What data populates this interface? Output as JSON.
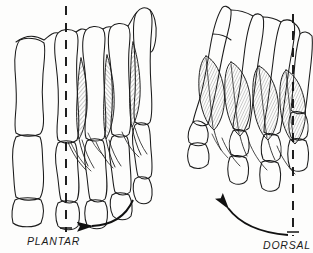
{
  "figure": {
    "title_left": "PLANTAR",
    "title_right": "DORSAL",
    "background_color": "#fdfdfc",
    "ink_color": "#1b1b1b",
    "hatch_color": "#555555"
  },
  "panels": [
    {
      "id": "plantar",
      "label": "PLANTAR",
      "view": "plantar view of foot skeleton",
      "axis_line": "dashed vertical axis through second metatarsal ray",
      "muscles": "plantar interossei, narrow elongated hatched bellies",
      "muscle_count": 3,
      "ray_count": 5,
      "arrow_direction": "counterclockwise arc, arrowhead pointing left"
    },
    {
      "id": "dorsal",
      "label": "DORSAL",
      "view": "dorsal view of foot skeleton, obliquely rotated",
      "axis_line": "dashed vertical axis through second metatarsal ray",
      "muscles": "dorsal interossei, broad teardrop hatched bellies",
      "muscle_count": 4,
      "ray_count": 5,
      "arrow_direction": "clockwise arc, arrowhead pointing up-left"
    }
  ],
  "icons": {
    "arrow_left": "curved-arrow-left-icon",
    "arrow_upleft": "curved-arrow-upleft-icon",
    "axis": "dashed-axis-line-icon"
  }
}
